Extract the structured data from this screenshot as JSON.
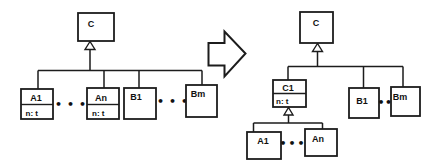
{
  "colors": {
    "background": "#ffffff",
    "stroke": "#1c1c1c",
    "text": "#111111"
  },
  "before": {
    "superclass": {
      "name": "C"
    },
    "a1": {
      "name": "A1",
      "attr": "n: t"
    },
    "an": {
      "name": "An",
      "attr": "n: t"
    },
    "b1": {
      "name": "B1"
    },
    "bm": {
      "name": "Bm"
    },
    "ellipsis_a": "•••",
    "ellipsis_b": "•••"
  },
  "after": {
    "superclass": {
      "name": "C"
    },
    "c1": {
      "name": "C1",
      "attr": "n: t"
    },
    "b1": {
      "name": "B1"
    },
    "bm": {
      "name": "Bm"
    },
    "a1": {
      "name": "A1"
    },
    "an": {
      "name": "An"
    },
    "ellipsis_a": "•••",
    "ellipsis_b": "••"
  }
}
